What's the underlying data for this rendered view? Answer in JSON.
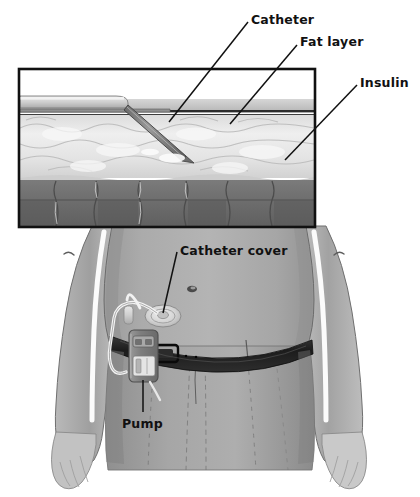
{
  "figure": {
    "width": 420,
    "height": 497,
    "style": "grayscale medical line illustration"
  },
  "labels": {
    "catheter": "Catheter",
    "fat_layer": "Fat layer",
    "insulin": "Insulin",
    "catheter_cover": "Catheter cover",
    "pump": "Pump"
  },
  "inset": {
    "name": "cross-section-detail",
    "description": "magnified cross section of skin, fat layer and muscle with inserted catheter",
    "layers": [
      {
        "name": "skin-surface",
        "tone": "#c8c8c8"
      },
      {
        "name": "dermis-line",
        "tone": "#3a3a3a"
      },
      {
        "name": "fat-layer",
        "tone": "#e6e6e6"
      },
      {
        "name": "muscle-layer",
        "tone": "#6e6e6e"
      }
    ],
    "box": {
      "x": 18,
      "y": 68,
      "width": 298,
      "height": 160,
      "border": "#111111"
    }
  },
  "body": {
    "name": "male-torso",
    "skin_tone": "#a9a9a9",
    "belt_tone": "#202020",
    "trousers_tone": "#9e9e9e",
    "parts": [
      "left-arm",
      "right-arm",
      "abdomen",
      "navel",
      "belt",
      "trousers",
      "left-hand",
      "right-hand"
    ]
  },
  "device": {
    "pump": {
      "name": "insulin-pump",
      "body_tone": "#808080",
      "screen_tone": "#d8d8d8"
    },
    "tubing": {
      "name": "catheter-tubing",
      "tone": "#f2f2f2"
    },
    "cover": {
      "name": "catheter-cover-patch",
      "tone": "#d4d4d4"
    },
    "connector": {
      "name": "tubing-connector",
      "tone": "#ededed"
    }
  },
  "colors": {
    "ink": "#111111",
    "paper": "#ffffff",
    "skin_mid": "#a9a9a9",
    "skin_dark": "#8a8a8a",
    "skin_light": "#c5c5c5",
    "muscle": "#6e6e6e",
    "fat": "#e9e9e9"
  }
}
